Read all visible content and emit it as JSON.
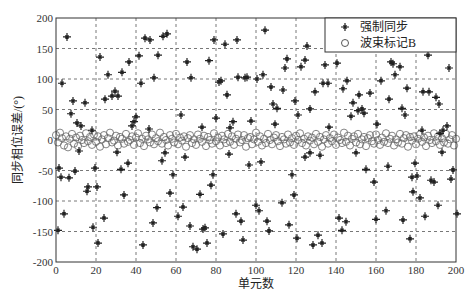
{
  "chart_data": {
    "type": "scatter",
    "title": "",
    "xlabel": "单元数",
    "ylabel": "同步相位误差/(°)",
    "xlim": [
      0,
      200
    ],
    "ylim": [
      -200,
      200
    ],
    "xticks": [
      0,
      20,
      40,
      60,
      80,
      100,
      120,
      140,
      160,
      180,
      200
    ],
    "yticks": [
      200,
      150,
      100,
      50,
      0,
      -50,
      -100,
      -150,
      -200
    ],
    "grid": true,
    "legend_position": "upper right",
    "series": [
      {
        "name": "强制同步",
        "marker": "star",
        "points": [
          [
            5.5,
            169
          ],
          [
            22,
            136
          ],
          [
            3,
            93
          ],
          [
            44.5,
            167
          ],
          [
            47,
            164
          ],
          [
            53.5,
            170
          ],
          [
            55.5,
            174
          ],
          [
            36.5,
            128
          ],
          [
            41.5,
            138
          ],
          [
            51,
            139
          ],
          [
            26,
            107
          ],
          [
            33,
            111
          ],
          [
            42.5,
            93
          ],
          [
            49,
            102
          ],
          [
            29.5,
            80
          ],
          [
            28,
            72
          ],
          [
            31,
            72
          ],
          [
            24.5,
            67
          ],
          [
            8.5,
            64
          ],
          [
            14.5,
            61
          ],
          [
            7.5,
            43
          ],
          [
            40,
            38
          ],
          [
            39,
            30
          ],
          [
            38,
            23
          ],
          [
            10.5,
            28
          ],
          [
            12.5,
            23
          ],
          [
            18,
            16
          ],
          [
            46.5,
            18
          ],
          [
            62.5,
            41
          ],
          [
            104.5,
            180
          ],
          [
            79,
            164
          ],
          [
            84.5,
            157
          ],
          [
            90.5,
            164
          ],
          [
            125.5,
            154
          ],
          [
            65.5,
            128
          ],
          [
            76.5,
            130
          ],
          [
            115.5,
            133
          ],
          [
            114.5,
            118
          ],
          [
            124.5,
            131
          ],
          [
            122.5,
            120
          ],
          [
            67.5,
            102
          ],
          [
            81.5,
            95
          ],
          [
            82.5,
            97
          ],
          [
            91,
            103
          ],
          [
            94.5,
            102
          ],
          [
            95.5,
            103
          ],
          [
            100.5,
            100
          ],
          [
            103.5,
            107
          ],
          [
            85.5,
            74
          ],
          [
            107.5,
            87
          ],
          [
            113.5,
            82
          ],
          [
            129.5,
            79
          ],
          [
            119.5,
            64
          ],
          [
            108.5,
            59
          ],
          [
            110.5,
            52
          ],
          [
            127,
            51
          ],
          [
            80,
            36
          ],
          [
            88.5,
            30
          ],
          [
            97.5,
            31
          ],
          [
            73,
            21
          ],
          [
            87,
            20
          ],
          [
            109.5,
            26
          ],
          [
            121,
            41
          ],
          [
            186,
            139
          ],
          [
            134.5,
            123
          ],
          [
            140.5,
            126
          ],
          [
            167.5,
            128
          ],
          [
            168.5,
            125
          ],
          [
            172,
            120
          ],
          [
            169.5,
            107
          ],
          [
            196.5,
            118
          ],
          [
            133.5,
            93
          ],
          [
            136,
            93
          ],
          [
            145.5,
            97
          ],
          [
            162.5,
            97
          ],
          [
            143.5,
            84
          ],
          [
            151.5,
            74
          ],
          [
            157,
            77
          ],
          [
            175.5,
            85
          ],
          [
            183.5,
            79
          ],
          [
            186.5,
            79
          ],
          [
            190,
            70
          ],
          [
            191.5,
            59
          ],
          [
            166.5,
            67
          ],
          [
            148.5,
            61
          ],
          [
            173,
            52
          ],
          [
            174.5,
            41
          ],
          [
            151,
            48
          ],
          [
            153,
            51
          ],
          [
            154,
            44
          ],
          [
            147.5,
            39
          ],
          [
            160.5,
            26
          ],
          [
            136.5,
            21
          ],
          [
            183,
            16
          ],
          [
            195.5,
            23
          ],
          [
            193.5,
            16
          ],
          [
            192,
            11
          ],
          [
            11.5,
            -18
          ],
          [
            30.5,
            -20
          ],
          [
            1.5,
            -46
          ],
          [
            9.5,
            -51
          ],
          [
            19.5,
            -46
          ],
          [
            32.5,
            -48
          ],
          [
            36,
            -38
          ],
          [
            2.5,
            -61
          ],
          [
            6.5,
            -62
          ],
          [
            16,
            -77
          ],
          [
            15.5,
            -84
          ],
          [
            20.5,
            -77
          ],
          [
            34,
            -90
          ],
          [
            4,
            -121
          ],
          [
            24,
            -128
          ],
          [
            1,
            -148
          ],
          [
            18.5,
            -143
          ],
          [
            21,
            -169
          ],
          [
            43.5,
            -172
          ],
          [
            54.5,
            -21
          ],
          [
            53,
            -34
          ],
          [
            58.5,
            -57
          ],
          [
            64.5,
            -28
          ],
          [
            57,
            -87
          ],
          [
            50.5,
            -111
          ],
          [
            63.5,
            -110
          ],
          [
            61,
            -125
          ],
          [
            48.5,
            -136
          ],
          [
            67,
            -141
          ],
          [
            68.5,
            -175
          ],
          [
            86.5,
            -23
          ],
          [
            96.5,
            -41
          ],
          [
            102.5,
            -36
          ],
          [
            124.5,
            -28
          ],
          [
            127,
            -21
          ],
          [
            132,
            -25
          ],
          [
            78.5,
            -57
          ],
          [
            77.5,
            -74
          ],
          [
            72,
            -89
          ],
          [
            118,
            -57
          ],
          [
            119,
            -90
          ],
          [
            100,
            -107
          ],
          [
            101.5,
            -116
          ],
          [
            113,
            -103
          ],
          [
            90,
            -121
          ],
          [
            92.5,
            -133
          ],
          [
            105.5,
            -133
          ],
          [
            106.5,
            -149
          ],
          [
            116.5,
            -139
          ],
          [
            73.5,
            -146
          ],
          [
            74.5,
            -144
          ],
          [
            83.5,
            -154
          ],
          [
            70.5,
            -179
          ],
          [
            75.5,
            -169
          ],
          [
            93.5,
            -164
          ],
          [
            120.5,
            -161
          ],
          [
            131,
            -156
          ],
          [
            128.5,
            -172
          ],
          [
            133,
            -169
          ],
          [
            150,
            -21
          ],
          [
            193,
            -20
          ],
          [
            155,
            -48
          ],
          [
            166,
            -43
          ],
          [
            179.5,
            -38
          ],
          [
            198.5,
            -49
          ],
          [
            197.5,
            -64
          ],
          [
            159,
            -69
          ],
          [
            178,
            -61
          ],
          [
            180.5,
            -59
          ],
          [
            187.5,
            -66
          ],
          [
            189,
            -69
          ],
          [
            178.5,
            -85
          ],
          [
            182,
            -95
          ],
          [
            191,
            -107
          ],
          [
            200.5,
            -121
          ],
          [
            165,
            -116
          ],
          [
            141.5,
            -128
          ],
          [
            145,
            -134
          ],
          [
            160,
            -130
          ],
          [
            173.5,
            -131
          ],
          [
            184.5,
            -125
          ],
          [
            143,
            -148
          ],
          [
            177,
            -162
          ]
        ]
      },
      {
        "name": "波束标记B",
        "marker": "circle",
        "y_values": [
          8,
          -4,
          12,
          3,
          -9,
          6,
          -12,
          2,
          10,
          -6,
          4,
          -10,
          7,
          0,
          -5,
          11,
          -2,
          5,
          -8,
          9,
          -3,
          6,
          -11,
          1,
          8,
          -7,
          3,
          12,
          -4,
          -1,
          7,
          -9,
          5,
          2,
          -6,
          10,
          -3,
          0,
          6,
          -8,
          4,
          11,
          -5,
          2,
          -10,
          7,
          1,
          -4,
          9,
          -7,
          3,
          -2,
          12,
          -6,
          5,
          0,
          -9,
          8,
          2,
          -4,
          10,
          -7,
          4,
          -1,
          6,
          -11,
          3,
          8,
          -5,
          1,
          -8,
          9,
          2,
          -3,
          7,
          -10,
          5,
          0,
          -6,
          11,
          -2,
          4,
          -9,
          7,
          1,
          -5,
          10,
          -3,
          6,
          -8,
          2,
          9,
          -4,
          0,
          8,
          -11,
          3,
          5,
          -7,
          1,
          12,
          -3,
          6,
          -9,
          2,
          -5,
          10,
          0,
          -7,
          4,
          8,
          -2,
          -10,
          5,
          1,
          -6,
          9,
          -4,
          3,
          -8,
          7,
          0,
          11,
          -5,
          2,
          -9,
          6,
          -1,
          4,
          -7,
          10,
          -3,
          5,
          -11,
          1,
          8,
          -6,
          3,
          -2,
          9,
          -8,
          4,
          0,
          -5,
          12,
          -3,
          7,
          -9,
          2,
          6,
          -4,
          10,
          -7,
          1,
          5,
          -10,
          3,
          8,
          -2,
          -6,
          9,
          0,
          -8,
          4,
          -3,
          11,
          -5,
          2,
          7,
          -9,
          1,
          -4,
          10,
          -6,
          3,
          8,
          -11,
          5,
          -1,
          6,
          -7,
          2,
          9,
          -3,
          4,
          -10,
          7,
          0,
          -5,
          11,
          -2,
          6,
          -8,
          3,
          -4,
          10,
          -6,
          1,
          8,
          -9,
          2
        ]
      }
    ]
  },
  "legend": {
    "items": [
      {
        "label": "强制同步",
        "marker": "star"
      },
      {
        "label": "波束标记B",
        "marker": "circle"
      }
    ]
  },
  "axes": {
    "xlabel": "单元数",
    "ylabel": "同步相位误差/(°)"
  }
}
